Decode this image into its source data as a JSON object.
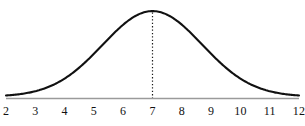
{
  "chart_data": {
    "type": "line",
    "title": "",
    "subtitle": "",
    "xlabel": "",
    "ylabel": "",
    "grid": false,
    "legend": false,
    "legend_position": "none",
    "distribution": "normal",
    "mean": 7,
    "std_dev": 1.7,
    "xlim": [
      2,
      12
    ],
    "ylim": [
      0,
      1
    ],
    "x_ticks": [
      2,
      3,
      4,
      5,
      6,
      7,
      8,
      9,
      10,
      11,
      12
    ],
    "x_tick_labels": [
      "2",
      "3",
      "4",
      "5",
      "6",
      "7",
      "8",
      "9",
      "10",
      "11",
      "12"
    ],
    "y_ticks": [],
    "y_tick_labels": [],
    "annotations": [
      {
        "name": "mean-line",
        "type": "vertical-dotted-line",
        "x": 7,
        "label": ""
      }
    ],
    "series": [
      {
        "name": "normal-curve",
        "x": [
          2,
          2.5,
          3,
          3.5,
          4,
          4.5,
          5,
          5.5,
          6,
          6.5,
          7,
          7.5,
          8,
          8.5,
          9,
          9.5,
          10,
          10.5,
          11,
          11.5,
          12
        ],
        "values": [
          0.01,
          0.02,
          0.04,
          0.08,
          0.15,
          0.26,
          0.41,
          0.59,
          0.76,
          0.93,
          1.0,
          0.93,
          0.76,
          0.59,
          0.41,
          0.26,
          0.15,
          0.08,
          0.04,
          0.02,
          0.01
        ]
      }
    ]
  },
  "style": {
    "curve_color": "#111111",
    "axis_color": "#9a9a9a",
    "dotted_line_color": "#1a1a1a",
    "label_color": "#111111",
    "background": "#ffffff"
  }
}
